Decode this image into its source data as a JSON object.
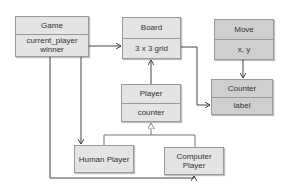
{
  "classes": {
    "game": {
      "name": "Game",
      "attributes": [
        "current_player",
        "winner"
      ]
    },
    "board": {
      "name": "Board",
      "attributes": [
        "3 x 3 grid"
      ]
    },
    "move": {
      "name": "Move",
      "attributes": [
        "x, y"
      ]
    },
    "counter": {
      "name": "Counter",
      "attributes": [
        "label"
      ]
    },
    "player": {
      "name": "Player",
      "attributes": [
        "counter"
      ]
    },
    "human_player": {
      "name": "Human Player"
    },
    "computer_player": {
      "name": "Computer Player"
    }
  },
  "colors": {
    "box": "#e4e4e4",
    "box_dark": "#cfcfcf",
    "line": "#444444",
    "border": "#9a9a9a"
  }
}
